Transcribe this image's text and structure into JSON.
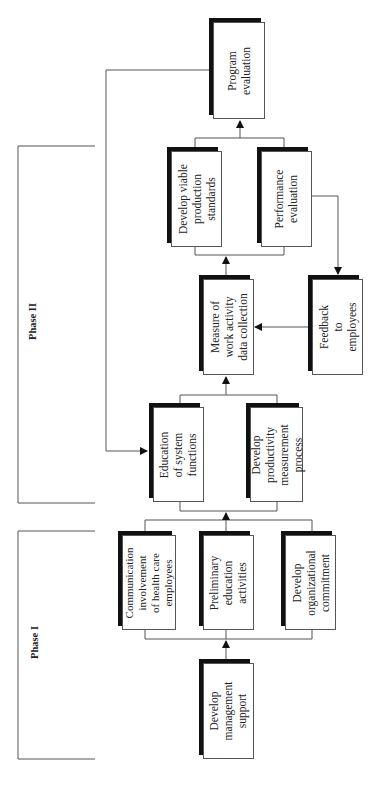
{
  "diagram": {
    "phases": [
      {
        "id": "phase-1",
        "label": "Phase I"
      },
      {
        "id": "phase-2",
        "label": "Phase II"
      }
    ],
    "nodes": [
      {
        "id": "develop-management-support",
        "label": "Develop\nmanagement\nsupport",
        "phase": "Phase I"
      },
      {
        "id": "communication-involvement",
        "label": "Communication\ninvolvement\nof health care\nemployees",
        "phase": "Phase I"
      },
      {
        "id": "preliminary-education",
        "label": "Preliminary\neducation\nactivities",
        "phase": "Phase I"
      },
      {
        "id": "develop-organizational-commitment",
        "label": "Develop\norganizational\ncommitment",
        "phase": "Phase I"
      },
      {
        "id": "education-system-functions",
        "label": "Education\nof system\nfunctions",
        "phase": "Phase II"
      },
      {
        "id": "develop-productivity-measurement",
        "label": "Develop\nproductivity\nmeasurement\nprocess",
        "phase": "Phase II"
      },
      {
        "id": "measure-work-activity",
        "label": "Measure of\nwork activity\ndata collection",
        "phase": "Phase II"
      },
      {
        "id": "feedback-to-employees",
        "label": "Feedback\nto\nemployees",
        "phase": "Phase II"
      },
      {
        "id": "develop-viable-standards",
        "label": "Develop viable\nproduction\nstandards",
        "phase": "Phase II"
      },
      {
        "id": "performance-evaluation",
        "label": "Performance\nevaluation",
        "phase": "Phase II"
      },
      {
        "id": "program-evaluation",
        "label": "Program\nevaluation",
        "phase": "Phase II"
      }
    ],
    "edges": [
      {
        "from": "develop-management-support",
        "to": [
          "communication-involvement",
          "preliminary-education",
          "develop-organizational-commitment"
        ]
      },
      {
        "from": [
          "communication-involvement",
          "preliminary-education",
          "develop-organizational-commitment"
        ],
        "to": [
          "education-system-functions",
          "develop-productivity-measurement"
        ]
      },
      {
        "from": [
          "education-system-functions",
          "develop-productivity-measurement"
        ],
        "to": "measure-work-activity"
      },
      {
        "from": "measure-work-activity",
        "to": [
          "develop-viable-standards",
          "performance-evaluation"
        ]
      },
      {
        "from": [
          "develop-viable-standards",
          "performance-evaluation"
        ],
        "to": "program-evaluation"
      },
      {
        "from": "performance-evaluation",
        "to": "feedback-to-employees"
      },
      {
        "from": "feedback-to-employees",
        "to": "measure-work-activity"
      },
      {
        "from": "program-evaluation",
        "to": "education-system-functions"
      }
    ]
  }
}
